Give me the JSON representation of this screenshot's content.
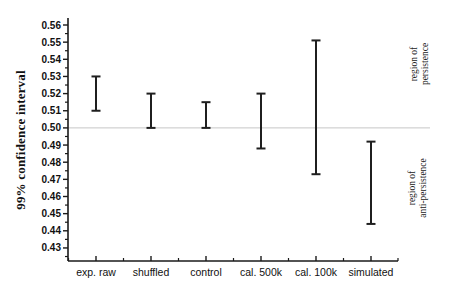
{
  "chart_data": {
    "type": "error-bar",
    "title": "",
    "xlabel": "",
    "ylabel": "99% confidence interval",
    "categories": [
      "exp. raw",
      "shuffled",
      "control",
      "cal. 500k",
      "cal. 100k",
      "simulated"
    ],
    "series": [
      {
        "name": "99% confidence interval",
        "points": [
          {
            "category": "exp. raw",
            "low": 0.51,
            "high": 0.53
          },
          {
            "category": "shuffled",
            "low": 0.5,
            "high": 0.52
          },
          {
            "category": "control",
            "low": 0.5,
            "high": 0.515
          },
          {
            "category": "cal. 500k",
            "low": 0.488,
            "high": 0.52
          },
          {
            "category": "cal. 100k",
            "low": 0.473,
            "high": 0.551
          },
          {
            "category": "simulated",
            "low": 0.444,
            "high": 0.492
          }
        ]
      }
    ],
    "reference_line": {
      "value": 0.5,
      "color": "#c6c6c6"
    },
    "y_axis": {
      "min": 0.43,
      "max": 0.56,
      "step": 0.01,
      "minor_step": 0.005,
      "tick_labels": [
        "0.43",
        "0.44",
        "0.45",
        "0.46",
        "0.47",
        "0.48",
        "0.49",
        "0.50",
        "0.51",
        "0.52",
        "0.53",
        "0.54",
        "0.55",
        "0.56"
      ]
    },
    "ylim": [
      0.422,
      0.564
    ],
    "grid": "off",
    "legend": "none",
    "annotations": [
      {
        "lines": [
          "region of",
          "persistence"
        ],
        "region": "upper-right"
      },
      {
        "lines": [
          "region of",
          "anti-persistence"
        ],
        "region": "lower-right"
      }
    ],
    "colors": {
      "error_bar": "#1f1f1f",
      "axis": "#1a1a1a",
      "text": "#111111",
      "background": "#ffffff"
    }
  }
}
